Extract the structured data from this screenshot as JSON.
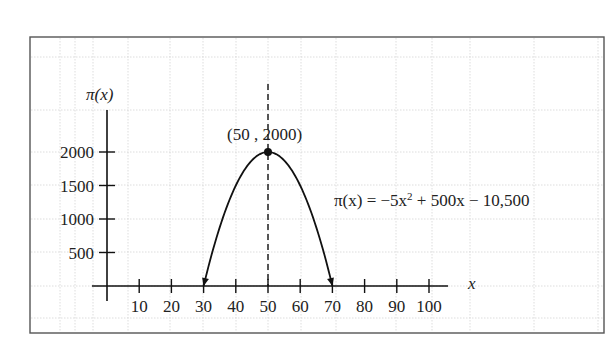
{
  "chart_data": {
    "type": "line",
    "title": "",
    "xlabel": "x",
    "ylabel": "π(x)",
    "xlim": [
      0,
      105
    ],
    "ylim": [
      0,
      2200
    ],
    "x_ticks": [
      10,
      20,
      30,
      40,
      50,
      60,
      70,
      80,
      90,
      100
    ],
    "x_tick_labels": [
      "10",
      "20",
      "30",
      "40",
      "50",
      "60",
      "70",
      "80",
      "90",
      "100"
    ],
    "y_ticks": [
      500,
      1000,
      1500,
      2000
    ],
    "y_tick_labels": [
      "500",
      "1000",
      "1500",
      "2000"
    ],
    "grid": true,
    "series": [
      {
        "name": "π(x) = −5x² + 500x − 10,500",
        "function": "-5*x^2 + 500*x - 10500",
        "x": [
          30,
          35,
          40,
          45,
          50,
          55,
          60,
          65,
          70
        ],
        "values": [
          0,
          1125,
          1500,
          1875,
          2000,
          1875,
          1500,
          1125,
          0
        ],
        "arrow_ends": true
      }
    ],
    "annotations": [
      {
        "type": "point",
        "x": 50,
        "y": 2000,
        "label": "(50 , 2000)"
      },
      {
        "type": "vline",
        "x": 50,
        "style": "dashed"
      },
      {
        "type": "text",
        "label": "π(x) = −5x² + 500x − 10,500"
      }
    ]
  },
  "labels": {
    "y_axis": "π(x)",
    "x_axis": "x",
    "vertex": "(50 , 2000)",
    "equation_prefix": "π(x) = −5x",
    "equation_sup": "2",
    "equation_suffix": " + 500x − 10,500"
  }
}
